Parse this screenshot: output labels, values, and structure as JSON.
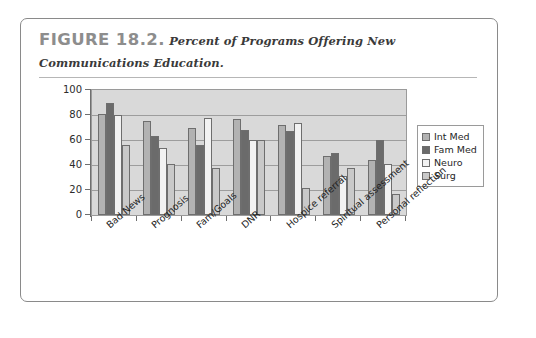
{
  "figure": {
    "label": "FIGURE 18.2.",
    "title": "Percent of Programs Offering New Communications Education."
  },
  "chart_data": {
    "type": "bar",
    "title": "Percent of Programs Offering New Communications Education.",
    "xlabel": "",
    "ylabel": "",
    "ylim": [
      0,
      100
    ],
    "yticks": [
      0,
      20,
      40,
      60,
      80,
      100
    ],
    "grid": true,
    "legend_position": "right",
    "categories": [
      "Bad News",
      "Prognosis",
      "Fam/Goals",
      "DNR",
      "Hospice referral",
      "Spiritual assessment",
      "Personal reflection"
    ],
    "series": [
      {
        "name": "Int Med",
        "color": "#b2b2b2",
        "values": [
          81,
          75,
          70,
          77,
          72,
          47,
          44
        ]
      },
      {
        "name": "Fam Med",
        "color": "#6b6b6b",
        "values": [
          90,
          63,
          56,
          68,
          67,
          50,
          60
        ]
      },
      {
        "name": "Neuro",
        "color": "#f2f2f2",
        "values": [
          80,
          54,
          78,
          60,
          74,
          31,
          41
        ]
      },
      {
        "name": "Surg",
        "color": "#c9c9c9",
        "values": [
          56,
          41,
          38,
          60,
          22,
          38,
          17
        ]
      }
    ]
  }
}
